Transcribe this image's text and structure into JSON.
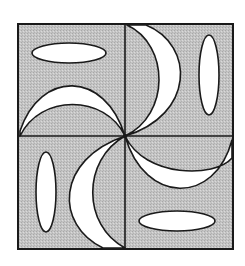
{
  "figure": {
    "colors": {
      "background": "#ffffff",
      "fill_gray": "#c8c8c8",
      "shape_white": "#ffffff",
      "stroke": "#1a1a1a"
    },
    "outer_square": {
      "x": 18,
      "y": 24,
      "width": 215,
      "height": 225
    },
    "center": {
      "x": 125,
      "y": 136
    },
    "quadrants": [
      {
        "name": "top-left",
        "ellipse": {
          "cx": 69,
          "cy": 53,
          "rx": 37,
          "ry": 10,
          "orientation": "horizontal"
        },
        "crescent": "arch opening downward"
      },
      {
        "name": "top-right",
        "ellipse": {
          "cx": 209,
          "cy": 75,
          "rx": 10,
          "ry": 40,
          "orientation": "vertical"
        },
        "crescent": "arch opening left"
      },
      {
        "name": "bottom-left",
        "ellipse": {
          "cx": 46,
          "cy": 192,
          "rx": 10,
          "ry": 40,
          "orientation": "vertical"
        },
        "crescent": "arch opening right"
      },
      {
        "name": "bottom-right",
        "ellipse": {
          "cx": 177,
          "cy": 221,
          "rx": 38,
          "ry": 10,
          "orientation": "horizontal"
        },
        "crescent": "arch opening upward"
      }
    ]
  }
}
